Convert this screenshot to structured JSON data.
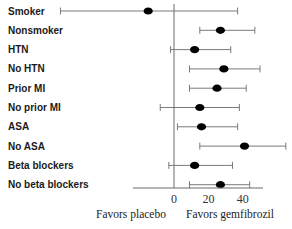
{
  "chart_data": {
    "type": "forest",
    "title": "",
    "xlabel": "",
    "ylabel": "",
    "xlim": [
      -70,
      66
    ],
    "xticks": [
      0,
      20,
      40
    ],
    "xtick_labels": [
      "0",
      "20",
      "40"
    ],
    "reference_line": 0,
    "annotations": {
      "left": "Favors placebo",
      "right": "Favors gemfibrozil"
    },
    "grid": false,
    "legend": "none",
    "rows": [
      {
        "label": "Smoker",
        "estimate": -15,
        "lower": -66,
        "upper": 37
      },
      {
        "label": "Nonsmoker",
        "estimate": 27,
        "lower": 15,
        "upper": 47
      },
      {
        "label": "HTN",
        "estimate": 12,
        "lower": -2,
        "upper": 33
      },
      {
        "label": "No HTN",
        "estimate": 29,
        "lower": 9,
        "upper": 50
      },
      {
        "label": "Prior MI",
        "estimate": 25,
        "lower": 9,
        "upper": 42
      },
      {
        "label": "No prior MI",
        "estimate": 15,
        "lower": -8,
        "upper": 38
      },
      {
        "label": "ASA",
        "estimate": 16,
        "lower": 2,
        "upper": 37
      },
      {
        "label": "No ASA",
        "estimate": 41,
        "lower": 15,
        "upper": 65
      },
      {
        "label": "Beta blockers",
        "estimate": 12,
        "lower": -3,
        "upper": 34
      },
      {
        "label": "No beta blockers",
        "estimate": 27,
        "lower": 9,
        "upper": 44
      }
    ],
    "colors": {
      "point": "#000000",
      "whisker": "#7a7a7a",
      "axis": "#6a6a6a",
      "text": "#1a1a1a"
    }
  }
}
